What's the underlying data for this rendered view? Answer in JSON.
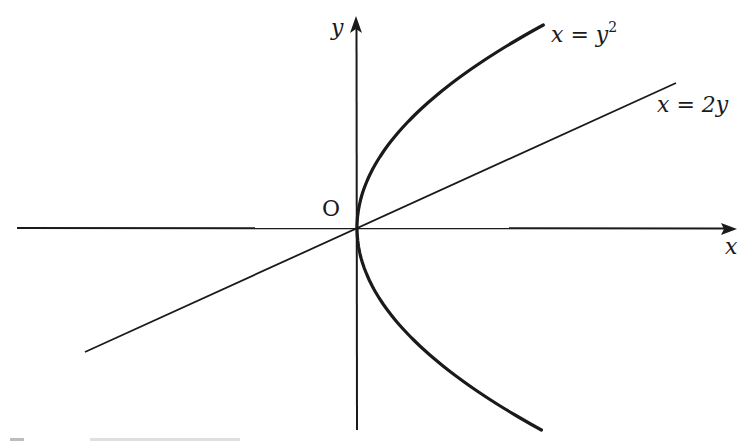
{
  "diagram": {
    "axes": {
      "x_label": "x",
      "y_label": "y",
      "origin_label": "O"
    },
    "curves": [
      {
        "id": "parabola",
        "label_base": "x = y",
        "label_exp": "2",
        "equation": "x = y^2"
      },
      {
        "id": "line",
        "label": "x = 2y",
        "equation": "x = 2y"
      }
    ],
    "colors": {
      "stroke": "#1a1a1a",
      "background": "#ffffff"
    }
  }
}
